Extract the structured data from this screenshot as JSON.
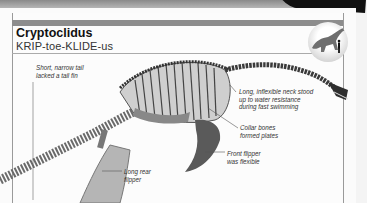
{
  "header": {
    "title": "Cryptoclidus",
    "pronunciation": "KRIP-toe-KLIDE-us"
  },
  "silhouette": {
    "icon": "plesiosaur-vs-human-scale-icon",
    "accent_color": "#6e6e6e"
  },
  "annotations": [
    {
      "id": "tail",
      "text_lines": [
        "Short, narrow tail",
        "lacked a tail fin"
      ]
    },
    {
      "id": "neck",
      "text_lines": [
        "Long, inflexible neck stood",
        "up to water resistance",
        "during fast swimming"
      ]
    },
    {
      "id": "collar",
      "text_lines": [
        "Collar bones",
        "formed plates"
      ]
    },
    {
      "id": "front-flipper",
      "text_lines": [
        "Front flipper",
        "was flexible"
      ]
    },
    {
      "id": "rear-flipper",
      "text_lines": [
        "Long rear",
        "flipper"
      ]
    }
  ],
  "colors": {
    "bar": "#8d8d8d",
    "text": "#111111",
    "bone": "#7a7a7a"
  }
}
